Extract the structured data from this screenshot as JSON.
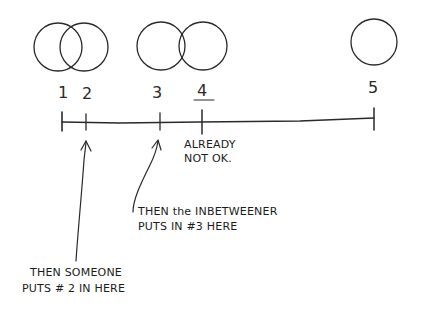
{
  "diagram": {
    "circles": [
      {
        "id": "1",
        "cx": 58,
        "cy": 47,
        "r": 24
      },
      {
        "id": "2",
        "cx": 84,
        "cy": 47,
        "r": 24
      },
      {
        "id": "3",
        "cx": 161,
        "cy": 46,
        "r": 24
      },
      {
        "id": "4",
        "cx": 203,
        "cy": 46,
        "r": 24
      },
      {
        "id": "5",
        "cx": 374,
        "cy": 42,
        "r": 23
      }
    ],
    "labels": {
      "n1": "1",
      "n2": "2",
      "n3": "3",
      "n4": "4",
      "n5": "5"
    },
    "number_line": {
      "ticks": [
        62,
        86,
        160,
        202,
        374
      ]
    },
    "annotations": {
      "already_line1": "ALREADY",
      "already_line2": "NOT OK.",
      "inbetweener_line1": "THEN the INBETWEENER",
      "inbetweener_line2": "PUTS IN #3 HERE",
      "someone_line1": "THEN SOMEONE",
      "someone_line2": "PUTS # 2 IN HERE"
    },
    "ink_color": "#2a2a2a"
  }
}
